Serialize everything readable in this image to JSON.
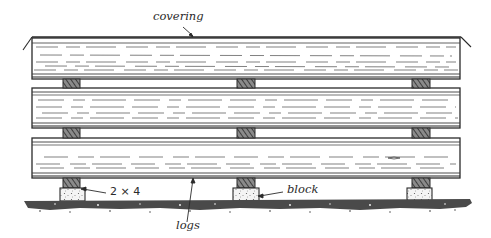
{
  "figure": {
    "labels": {
      "covering": "covering",
      "spacer": "2 × 4",
      "logs": "logs",
      "block": "block"
    },
    "colors": {
      "ink": "#2a2a2a",
      "background": "#ffffff",
      "spacer_fill": "#6a6a6a",
      "block_fill": "#f2f2f2",
      "ground": "#3a3a3a"
    },
    "logs": [
      {
        "name": "top-log",
        "x": 32,
        "y": 38,
        "width": 428,
        "height": 41
      },
      {
        "name": "middle-log",
        "x": 32,
        "y": 88,
        "width": 428,
        "height": 40
      },
      {
        "name": "bottom-log",
        "x": 32,
        "y": 138,
        "width": 428,
        "height": 40
      }
    ],
    "spacer_columns_x": [
      63,
      237,
      412
    ],
    "spacer_rows_y": [
      79,
      128,
      178
    ],
    "blocks": [
      {
        "x": 60,
        "y": 188,
        "width": 25,
        "height": 13
      },
      {
        "x": 233,
        "y": 188,
        "width": 26,
        "height": 13
      },
      {
        "x": 407,
        "y": 188,
        "width": 25,
        "height": 13
      }
    ]
  }
}
